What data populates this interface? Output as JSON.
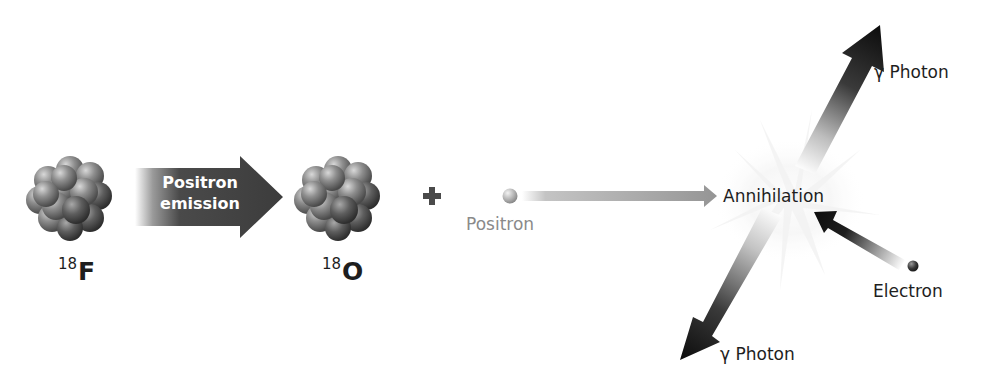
{
  "diagram": {
    "title": "",
    "nuclei": [
      {
        "id": "fluorine",
        "mass_number": "18",
        "symbol": "F"
      },
      {
        "id": "oxygen",
        "mass_number": "18",
        "symbol": "O"
      }
    ],
    "process_arrow": {
      "line1": "Positron",
      "line2": "emission"
    },
    "plus_sign": "+",
    "labels": {
      "positron": "Positron",
      "annihilation": "Annihilation",
      "photon_up": "γ Photon",
      "photon_down": "γ Photon",
      "electron": "Electron"
    },
    "colors": {
      "background": "#ffffff",
      "text": "#1e1e1e",
      "positron_label": "#8a8a8a",
      "nucleus": "#8c8c8c",
      "emission_arrow": "#3f3f3f",
      "positron_arrow": "#9a9a9a",
      "photon_arrow": "#111111"
    }
  }
}
